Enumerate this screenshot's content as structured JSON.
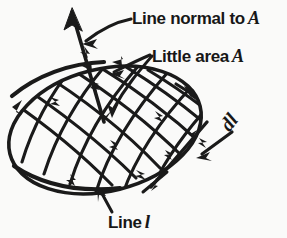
{
  "figure": {
    "caption_labels": {
      "line_normal": {
        "text": "Line normal to",
        "symbol": "A"
      },
      "little_area": {
        "text": "Little area",
        "symbol": "A"
      },
      "line_l": {
        "text": "Line",
        "symbol": "l"
      },
      "dl": {
        "text": "dl"
      }
    },
    "colors": {
      "ink": "#1a1a1a",
      "background": "#fafaf9"
    },
    "elements": {
      "surface": "ellipse-surface",
      "mesh": "cross-hatch-mesh",
      "normal_vector": "normal-arrow",
      "line_element": "dl-tangent-segment",
      "boundary_curve": "oriented-boundary-line-l"
    }
  }
}
